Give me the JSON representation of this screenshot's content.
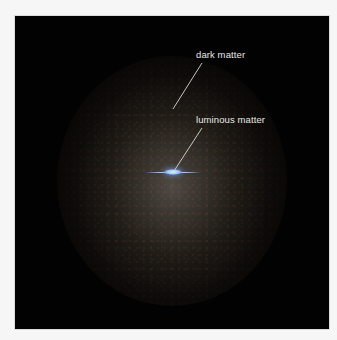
{
  "figure": {
    "background_color": "#f6f6f6",
    "panel_color": "#020202",
    "halo_color": "#7d786c",
    "disk_color": "#9cc6ff",
    "labels": [
      {
        "id": "dark-matter",
        "text": "dark matter"
      },
      {
        "id": "luminous-matter",
        "text": "luminous matter"
      }
    ]
  }
}
